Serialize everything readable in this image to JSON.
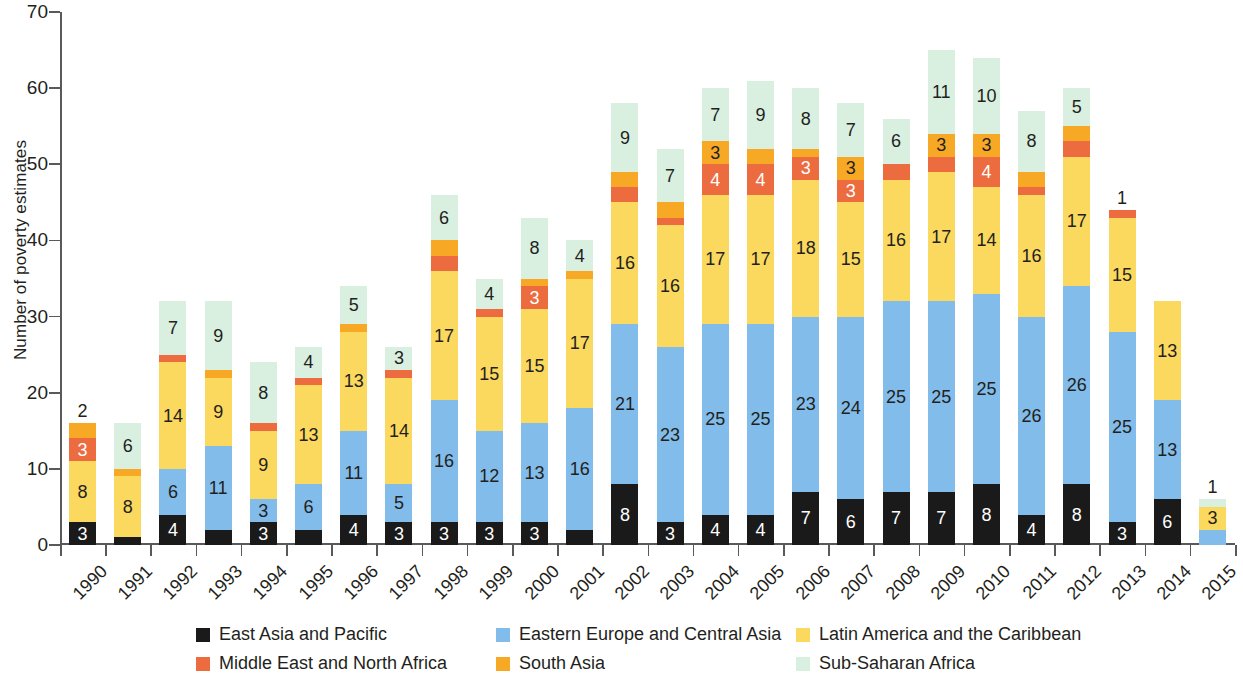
{
  "chart_data": {
    "type": "bar",
    "stacked": true,
    "title": "",
    "subtitle": "",
    "xlabel": "",
    "ylabel": "Number of poverty estimates",
    "ylim": [
      0,
      70
    ],
    "yticks": [
      0,
      10,
      20,
      30,
      40,
      50,
      60,
      70
    ],
    "grid": false,
    "legend_position": "bottom",
    "categories": [
      "1990",
      "1991",
      "1992",
      "1993",
      "1994",
      "1995",
      "1996",
      "1997",
      "1998",
      "1999",
      "2000",
      "2001",
      "2002",
      "2003",
      "2004",
      "2005",
      "2006",
      "2007",
      "2008",
      "2009",
      "2010",
      "2011",
      "2012",
      "2013",
      "2014",
      "2015"
    ],
    "series": [
      {
        "name": "East Asia and Pacific",
        "color": "#1a1a1a",
        "label_color": "#ffffff",
        "values": [
          3,
          1,
          4,
          2,
          3,
          2,
          4,
          3,
          3,
          3,
          3,
          2,
          8,
          3,
          4,
          4,
          7,
          6,
          7,
          7,
          8,
          4,
          8,
          3,
          6,
          0
        ]
      },
      {
        "name": "Eastern Europe and Central Asia",
        "color": "#82bcea",
        "label_color": "#231f20",
        "values": [
          0,
          0,
          6,
          11,
          3,
          6,
          11,
          5,
          16,
          12,
          13,
          16,
          21,
          23,
          25,
          25,
          23,
          24,
          25,
          25,
          25,
          26,
          26,
          25,
          13,
          2
        ]
      },
      {
        "name": "Latin America and the Caribbean",
        "color": "#fbd85e",
        "label_color": "#231f20",
        "values": [
          8,
          8,
          14,
          9,
          9,
          13,
          13,
          14,
          17,
          15,
          15,
          17,
          16,
          16,
          17,
          17,
          18,
          15,
          16,
          17,
          14,
          16,
          17,
          15,
          13,
          3
        ]
      },
      {
        "name": "Middle East and North Africa",
        "color": "#ec6b3f",
        "label_color": "#ffffff",
        "values": [
          3,
          0,
          1,
          0,
          1,
          1,
          0,
          1,
          2,
          1,
          3,
          0,
          2,
          1,
          4,
          4,
          3,
          3,
          2,
          2,
          4,
          1,
          2,
          1,
          0,
          0
        ]
      },
      {
        "name": "South Asia",
        "color": "#f7a825",
        "label_color": "#231f20",
        "values": [
          2,
          1,
          0,
          1,
          0,
          0,
          1,
          0,
          2,
          0,
          1,
          1,
          2,
          2,
          3,
          2,
          1,
          3,
          0,
          3,
          3,
          2,
          2,
          0,
          0,
          0
        ]
      },
      {
        "name": "Sub-Saharan Africa",
        "color": "#d9f0e1",
        "label_color": "#231f20",
        "values": [
          0,
          6,
          7,
          9,
          8,
          4,
          5,
          3,
          6,
          4,
          8,
          4,
          9,
          7,
          7,
          9,
          8,
          7,
          6,
          11,
          10,
          8,
          5,
          0,
          0,
          1
        ]
      }
    ],
    "totals": [
      16,
      16,
      32,
      32,
      24,
      26,
      34,
      26,
      46,
      35,
      43,
      40,
      58,
      52,
      60,
      61,
      60,
      58,
      56,
      65,
      64,
      57,
      60,
      44,
      32,
      6
    ]
  },
  "legend": {
    "items": [
      {
        "label": "East Asia and Pacific",
        "color": "#1a1a1a"
      },
      {
        "label": "Eastern Europe and Central Asia",
        "color": "#82bcea"
      },
      {
        "label": "Latin America and the Caribbean",
        "color": "#fbd85e"
      },
      {
        "label": "Middle East and North Africa",
        "color": "#ec6b3f"
      },
      {
        "label": "South Asia",
        "color": "#f7a825"
      },
      {
        "label": "Sub-Saharan Africa",
        "color": "#d9f0e1"
      }
    ]
  }
}
